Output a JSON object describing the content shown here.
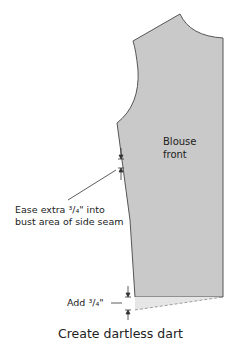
{
  "diagram": {
    "piece_label_line1": "Blouse",
    "piece_label_line2": "front",
    "ease_note_line1": "Ease extra ³/₄\" into",
    "ease_note_line2": "bust area of side seam",
    "add_note": "Add ³/₄\"",
    "caption": "Create dartless dart",
    "colors": {
      "piece_fill": "#c9c9c9",
      "extension_fill": "#e6e6e6",
      "outline": "#555555",
      "text": "#222222"
    }
  }
}
